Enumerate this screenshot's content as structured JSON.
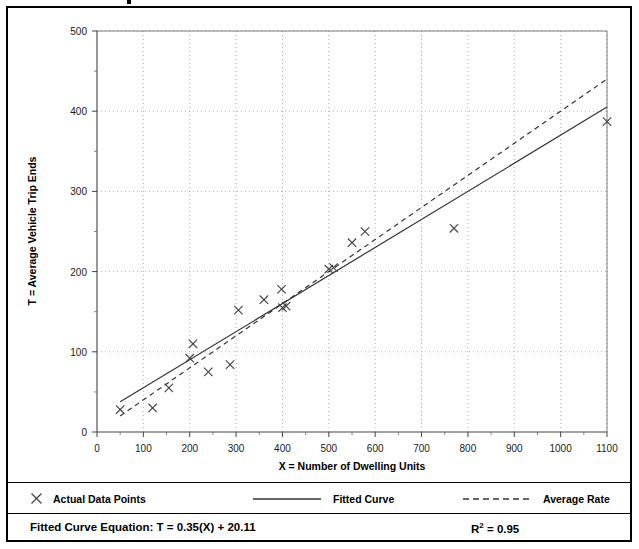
{
  "chart_data": {
    "type": "scatter",
    "title": "",
    "xlabel": "X = Number of Dwelling Units",
    "ylabel": "T = Average Vehicle Trip Ends",
    "xlim": [
      0,
      1100
    ],
    "ylim": [
      0,
      500
    ],
    "xticks": [
      0,
      100,
      200,
      300,
      400,
      500,
      600,
      700,
      800,
      900,
      1000,
      1100
    ],
    "xtick_labels": [
      "0",
      "100",
      "200",
      "300",
      "400",
      "500",
      "600",
      "700",
      "800",
      "900",
      "1000",
      "1100"
    ],
    "yticks": [
      0,
      100,
      200,
      300,
      400,
      500
    ],
    "ytick_labels": [
      "0",
      "100",
      "200",
      "300",
      "400",
      "500"
    ],
    "y_minor_ticks": [
      50,
      150,
      250,
      350,
      450
    ],
    "grid": "dotted-both",
    "legend_position": "below-plot",
    "series": [
      {
        "name": "Actual Data Points",
        "type": "scatter",
        "marker": "x",
        "color": "#444444",
        "points": [
          {
            "x": 50,
            "y": 28
          },
          {
            "x": 120,
            "y": 30
          },
          {
            "x": 155,
            "y": 55
          },
          {
            "x": 200,
            "y": 92
          },
          {
            "x": 207,
            "y": 110
          },
          {
            "x": 240,
            "y": 75
          },
          {
            "x": 287,
            "y": 84
          },
          {
            "x": 305,
            "y": 152
          },
          {
            "x": 360,
            "y": 165
          },
          {
            "x": 398,
            "y": 178
          },
          {
            "x": 400,
            "y": 155
          },
          {
            "x": 408,
            "y": 157
          },
          {
            "x": 500,
            "y": 203
          },
          {
            "x": 510,
            "y": 205
          },
          {
            "x": 550,
            "y": 236
          },
          {
            "x": 578,
            "y": 250
          },
          {
            "x": 770,
            "y": 254
          },
          {
            "x": 1100,
            "y": 387
          }
        ]
      },
      {
        "name": "Fitted Curve",
        "type": "line",
        "style": "solid",
        "color": "#333333",
        "equation": "T = 0.35(X) + 20.11",
        "slope": 0.35,
        "intercept": 20.11,
        "x_start": 50,
        "x_end": 1100
      },
      {
        "name": "Average Rate",
        "type": "line",
        "style": "dashed",
        "color": "#333333",
        "slope": 0.4,
        "intercept": 0,
        "x_start": 50,
        "x_end": 1100
      }
    ]
  },
  "legend": {
    "items": [
      {
        "label": "Actual Data Points",
        "marker": "x-marker-icon"
      },
      {
        "label": "Fitted Curve",
        "marker": "solid-line-icon"
      },
      {
        "label": "Average Rate",
        "marker": "dashed-line-icon"
      }
    ]
  },
  "footer": {
    "equation_label": "Fitted Curve Equation:",
    "equation_value": "T = 0.35(X) + 20.11",
    "equation_full": "Fitted Curve Equation:  T = 0.35(X) + 20.11",
    "rsq_prefix": "R",
    "rsq_exponent": "2",
    "rsq_value": "= 0.95"
  }
}
